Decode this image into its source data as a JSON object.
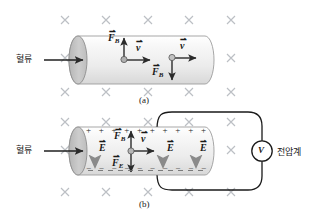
{
  "figure": {
    "title_a": "(a)",
    "title_b": "(b)",
    "background_color": "#ffffff",
    "field_mark_symbol": "×",
    "field_mark_color": "#b9bcc2",
    "cylinder_fill_light": "#f2f2f2",
    "cylinder_fill_dark": "#c9c9c9",
    "cylinder_stroke": "#9a9a9a",
    "vector_color": "#2b2b2b",
    "efield_arrow_color": "#8f8f8f",
    "wire_color": "#1a1a1a"
  },
  "panel_a": {
    "caption": "(a)",
    "flow_label": "혈류",
    "vectors": [
      {
        "name": "F_B",
        "label": "F",
        "subscript": "B",
        "direction": "up"
      },
      {
        "name": "v",
        "label": "v",
        "subscript": "",
        "direction": "right"
      },
      {
        "name": "v",
        "label": "v",
        "subscript": "",
        "direction": "right"
      },
      {
        "name": "F_B",
        "label": "F",
        "subscript": "B",
        "direction": "down"
      }
    ],
    "charges": [
      "positive-carrier",
      "negative-carrier"
    ]
  },
  "panel_b": {
    "caption": "(b)",
    "flow_label": "혈류",
    "meter_symbol": "V",
    "meter_label": "전압계",
    "plus_sign": "+",
    "minus_sign": "−",
    "plus_count": 10,
    "minus_count": 10,
    "vectors": [
      {
        "name": "E",
        "label": "E",
        "subscript": "",
        "direction": "down"
      },
      {
        "name": "F_B",
        "label": "F",
        "subscript": "B",
        "direction": "up"
      },
      {
        "name": "v",
        "label": "v",
        "subscript": "",
        "direction": "right"
      },
      {
        "name": "F_E",
        "label": "F",
        "subscript": "E",
        "direction": "down"
      },
      {
        "name": "E",
        "label": "E",
        "subscript": "",
        "direction": "down"
      },
      {
        "name": "E",
        "label": "E",
        "subscript": "",
        "direction": "down"
      }
    ]
  },
  "vector_labels": {
    "fb": "F",
    "fb_sub": "B",
    "fe": "F",
    "fe_sub": "E",
    "v": "v",
    "e": "E"
  }
}
